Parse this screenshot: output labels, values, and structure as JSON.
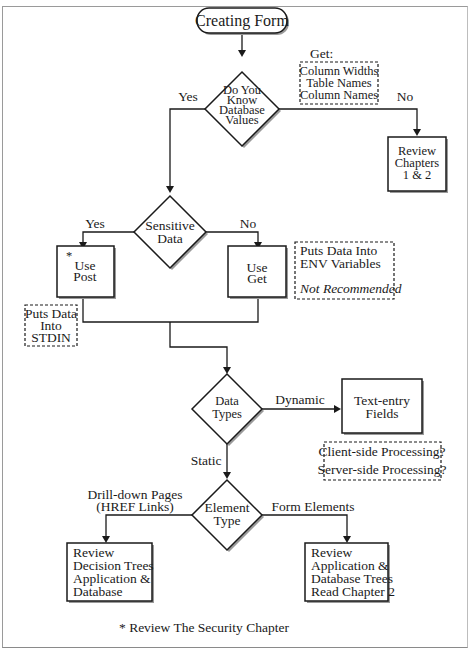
{
  "diagram": {
    "start": {
      "label": "Creating Form"
    },
    "decisions": [
      {
        "id": "know-db",
        "lines": [
          "Do You",
          "Know",
          "Database",
          "Values"
        ]
      },
      {
        "id": "sensitive",
        "lines": [
          "Sensitive",
          "Data"
        ]
      },
      {
        "id": "data-types",
        "lines": [
          "Data",
          "Types"
        ]
      },
      {
        "id": "element-type",
        "lines": [
          "Element",
          "Type"
        ]
      }
    ],
    "processes": [
      {
        "id": "review-ch",
        "lines": [
          "Review",
          "Chapters",
          "1 & 2"
        ]
      },
      {
        "id": "use-post",
        "marker": "*",
        "lines": [
          "Use",
          "Post"
        ]
      },
      {
        "id": "use-get",
        "lines": [
          "Use",
          "Get"
        ]
      },
      {
        "id": "text-entry",
        "lines": [
          "Text-entry",
          "Fields"
        ]
      },
      {
        "id": "review-decision",
        "lines": [
          "Review",
          "Decision Trees",
          "Application &",
          "Database"
        ]
      },
      {
        "id": "review-app",
        "lines": [
          "Review",
          "Application &",
          "Database Trees",
          "Read Chapter 2"
        ]
      }
    ],
    "notes": [
      {
        "id": "get-note",
        "title": "Get:",
        "lines": [
          "Column Widths",
          "Table Names",
          "Column Names"
        ]
      },
      {
        "id": "env-note",
        "lines": [
          "Puts Data Into",
          "ENV Variables"
        ],
        "italic": "Not Recommended"
      },
      {
        "id": "stdin-note",
        "lines": [
          "Puts Data",
          "Into",
          "STDIN"
        ]
      },
      {
        "id": "processing-note",
        "lines": [
          "Client-side Processing?",
          "Server-side Processing?"
        ]
      }
    ],
    "edge_labels": {
      "know_yes": "Yes",
      "know_no": "No",
      "sensitive_yes": "Yes",
      "sensitive_no": "No",
      "dynamic": "Dynamic",
      "static": "Static",
      "drill_down_1": "Drill-down Pages",
      "drill_down_2": "(HREF Links)",
      "form_elements": "Form Elements"
    },
    "footnote": "* Review The Security Chapter"
  }
}
